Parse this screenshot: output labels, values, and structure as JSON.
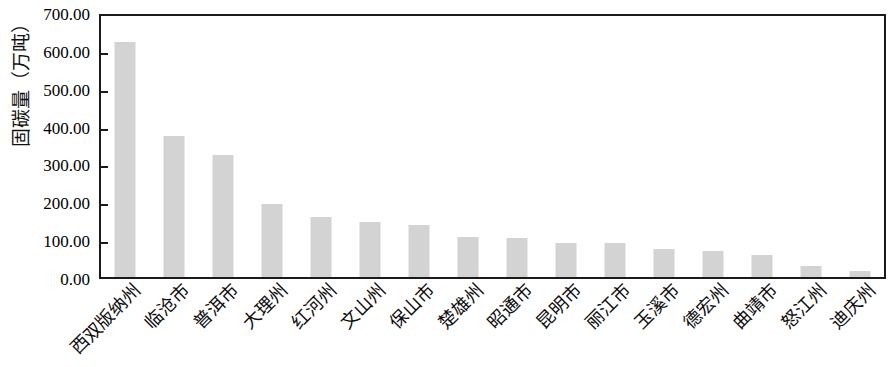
{
  "chart_data": {
    "type": "bar",
    "title": "",
    "subtitle": "",
    "xlabel": "",
    "ylabel": "固碳量（万吨）",
    "ylim": [
      0,
      700
    ],
    "y_tick_step": 100,
    "y_ticks": [
      "0.00",
      "100.00",
      "200.00",
      "300.00",
      "400.00",
      "500.00",
      "600.00",
      "700.00"
    ],
    "grid": false,
    "legend": false,
    "legend_position": "none",
    "bar_color": "#d3d3d3",
    "axis_color": "#1a1a1a",
    "categories": [
      "西双版纳州",
      "临沧市",
      "普洱市",
      "大理州",
      "红河州",
      "文山州",
      "保山市",
      "楚雄州",
      "昭通市",
      "昆明市",
      "丽江市",
      "玉溪市",
      "德宏州",
      "曲靖市",
      "怒江州",
      "迪庆州"
    ],
    "values": [
      620,
      372,
      322,
      193,
      158,
      145,
      137,
      105,
      102,
      90,
      89,
      73,
      70,
      59,
      29,
      16
    ]
  }
}
